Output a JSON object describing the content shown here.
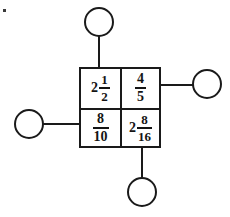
{
  "diagram": {
    "stroke_color": "#1a1a1a",
    "text_color": "#141414",
    "background_color": "#ffffff",
    "grid": {
      "rows": 2,
      "columns": 2,
      "cells": [
        {
          "position": "top-left",
          "type": "mixed-number",
          "whole": "2",
          "numerator": "1",
          "denominator": "2",
          "text": "2 1/2"
        },
        {
          "position": "top-right",
          "type": "fraction",
          "whole": "",
          "numerator": "4",
          "denominator": "5",
          "text": "4/5"
        },
        {
          "position": "bottom-left",
          "type": "fraction",
          "whole": "",
          "numerator": "8",
          "denominator": "10",
          "text": "8/10"
        },
        {
          "position": "bottom-right",
          "type": "mixed-number",
          "whole": "2",
          "numerator": "8",
          "denominator": "16",
          "text": "2 8/16"
        }
      ]
    },
    "circles": [
      {
        "position": "top",
        "label": ""
      },
      {
        "position": "right",
        "label": ""
      },
      {
        "position": "left",
        "label": ""
      },
      {
        "position": "bottom",
        "label": ""
      }
    ]
  }
}
